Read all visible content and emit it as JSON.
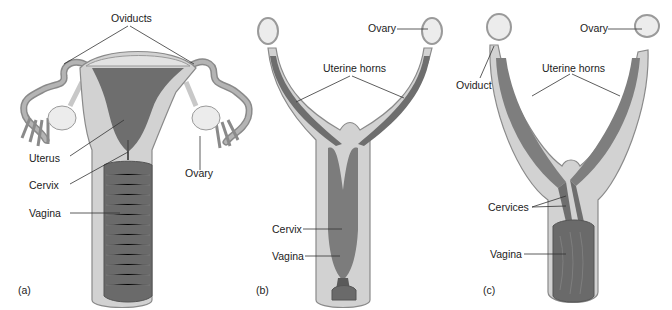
{
  "figure": {
    "panels": [
      {
        "id": "a",
        "label": "(a)",
        "labels": {
          "oviducts": "Oviducts",
          "uterus": "Uterus",
          "cervix": "Cervix",
          "vagina": "Vagina",
          "ovary": "Ovary"
        }
      },
      {
        "id": "b",
        "label": "(b)",
        "labels": {
          "ovary": "Ovary",
          "uterine_horns": "Uterine horns",
          "cervix": "Cervix",
          "vagina": "Vagina"
        }
      },
      {
        "id": "c",
        "label": "(c)",
        "labels": {
          "ovary": "Ovary",
          "oviduct": "Oviduct",
          "uterine_horns": "Uterine horns",
          "cervices": "Cervices",
          "vagina": "Vagina"
        }
      }
    ]
  },
  "colors": {
    "tissue_light": "#d2d2d2",
    "tissue_mid": "#a8a8a8",
    "lumen_dark": "#6e6e6e",
    "ovary": "#ececec",
    "leader_line": "#333333"
  }
}
